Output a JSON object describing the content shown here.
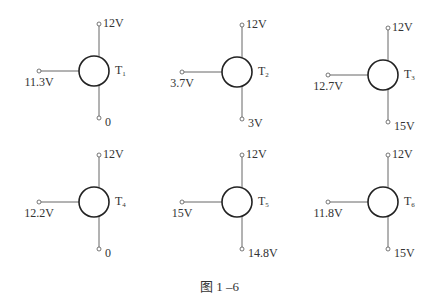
{
  "figure": {
    "caption": "图 1 –6",
    "transistors": [
      {
        "name": "T",
        "sub": "1",
        "top": "12V",
        "left": "11.3V",
        "bottom": "0",
        "cx": 94,
        "cy": 71
      },
      {
        "name": "T",
        "sub": "2",
        "top": "12V",
        "left": "3.7V",
        "bottom": "3V",
        "cx": 237,
        "cy": 72
      },
      {
        "name": "T",
        "sub": "3",
        "top": "12V",
        "left": "12.7V",
        "bottom": "15V",
        "cx": 383,
        "cy": 75
      },
      {
        "name": "T",
        "sub": "4",
        "top": "12V",
        "left": "12.2V",
        "bottom": "0",
        "cx": 94,
        "cy": 202
      },
      {
        "name": "T",
        "sub": "5",
        "top": "12V",
        "left": "15V",
        "bottom": "14.8V",
        "cx": 237,
        "cy": 202
      },
      {
        "name": "T",
        "sub": "6",
        "top": "12V",
        "left": "11.8V",
        "bottom": "15V",
        "cx": 383,
        "cy": 202
      }
    ]
  }
}
